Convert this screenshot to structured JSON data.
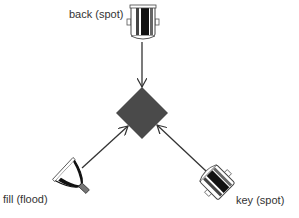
{
  "diagram": {
    "type": "three-point lighting",
    "subject": {
      "shape": "diamond",
      "color": "#4a4a4a"
    },
    "lights": [
      {
        "id": "back",
        "label": "back (spot)",
        "kind": "spot-light-icon",
        "position": "top"
      },
      {
        "id": "fill",
        "label": "fill (flood)",
        "kind": "flood-light-icon",
        "position": "bottom-left"
      },
      {
        "id": "key",
        "label": "key (spot)",
        "kind": "spot-light-icon",
        "position": "bottom-right"
      }
    ],
    "arrow_color": "#333333"
  }
}
